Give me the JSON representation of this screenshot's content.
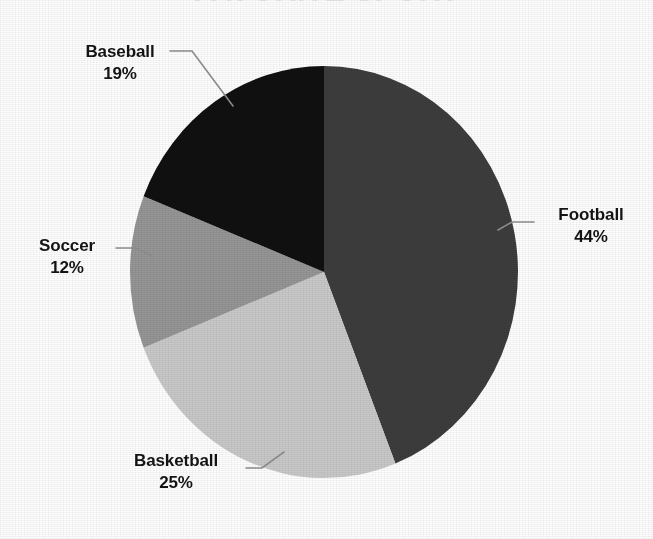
{
  "chart_data": {
    "type": "pie",
    "title": "FAVORITE SPORT",
    "title_visibility": "cropped-at-top-edge",
    "categories": [
      "Football",
      "Basketball",
      "Soccer",
      "Baseball"
    ],
    "values": [
      44,
      25,
      12,
      19
    ],
    "value_unit": "%",
    "labels": [
      {
        "name": "Football",
        "value": 44,
        "value_text": "44%",
        "color": "#3d3d3d",
        "position": "right"
      },
      {
        "name": "Basketball",
        "value": 25,
        "value_text": "25%",
        "color": "#c9c9c9",
        "position": "bottom-left"
      },
      {
        "name": "Soccer",
        "value": 12,
        "value_text": "12%",
        "color": "#969696",
        "position": "left"
      },
      {
        "name": "Baseball",
        "value": 19,
        "value_text": "19%",
        "color": "#101010",
        "position": "top-left"
      }
    ],
    "start_angle_deg": 0,
    "direction": "clockwise",
    "legend": "none",
    "data_labels": "outside-with-leader-lines",
    "grid": false,
    "background": "#ffffff"
  },
  "figure": {
    "leader_line_color": "#8f8f8f",
    "label_text_color": "#141414",
    "slice_border": "none"
  }
}
